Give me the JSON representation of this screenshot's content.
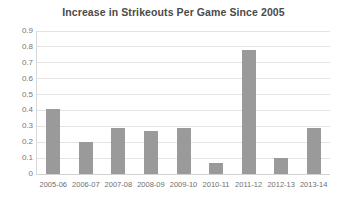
{
  "chart_data": {
    "type": "bar",
    "title": "Increase in Strikeouts Per Game Since 2005",
    "xlabel": "",
    "ylabel": "",
    "categories": [
      "2005-06",
      "2006-07",
      "2007-08",
      "2008-09",
      "2009-10",
      "2010-11",
      "2011-12",
      "2012-13",
      "2013-14"
    ],
    "values": [
      0.41,
      0.2,
      0.29,
      0.27,
      0.29,
      0.07,
      0.78,
      0.1,
      0.29
    ],
    "ylim": [
      0,
      0.9
    ],
    "ytick_labels": [
      "0.9",
      "0.8",
      "0.7",
      "0.6",
      "0.5",
      "0.4",
      "0.3",
      "0.2",
      "0.1",
      "0"
    ],
    "ytick_values": [
      0.9,
      0.8,
      0.7,
      0.6,
      0.5,
      0.4,
      0.3,
      0.2,
      0.1,
      0
    ],
    "grid": true,
    "legend": false,
    "series": [
      {
        "name": "Increase in Strikeouts Per Game",
        "color": "#9a9a9a",
        "values": [
          0.41,
          0.2,
          0.29,
          0.27,
          0.29,
          0.07,
          0.78,
          0.1,
          0.29
        ]
      }
    ],
    "bar_color": "#9a9a9a",
    "background_color": "#ffffff",
    "gridline_color": "#e4e4e4",
    "text_color": "#595959"
  }
}
